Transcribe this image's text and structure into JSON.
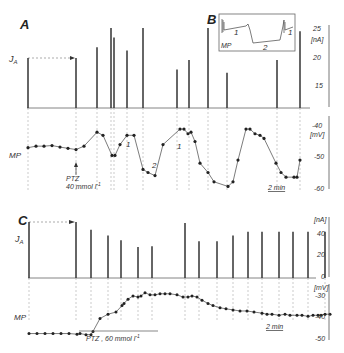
{
  "chart_data": [
    {
      "panel": "A",
      "type": "line",
      "title": "A",
      "series": [
        {
          "name": "J_A",
          "unit": "nA",
          "kind": "current pulses (stick plot)",
          "x_px": [
            28,
            76,
            97,
            111,
            114,
            127,
            143,
            177,
            189,
            208,
            227,
            277,
            300
          ],
          "values": [
            20.5,
            20.5,
            22,
            25,
            23.5,
            21.5,
            25,
            18.5,
            20,
            25,
            18,
            20,
            24.5
          ]
        },
        {
          "name": "MP",
          "unit": "mV",
          "x_px": [
            28,
            36,
            44,
            52,
            60,
            68,
            76,
            84,
            97,
            103,
            112,
            115,
            120,
            127,
            134,
            143,
            148,
            155,
            163,
            180,
            184,
            188,
            191,
            195,
            200,
            208,
            214,
            228,
            233,
            238,
            246,
            250,
            255,
            260,
            264,
            276,
            281,
            286,
            294,
            297,
            300
          ],
          "values": [
            -47,
            -46.5,
            -46.5,
            -46.3,
            -46.8,
            -47.2,
            -47.6,
            -46.5,
            -42,
            -43,
            -49.5,
            -49.5,
            -46,
            -43,
            -43,
            -54,
            -55,
            -56,
            -46,
            -41,
            -41,
            -42.5,
            -42,
            -45,
            -52,
            -55,
            -58,
            -59.5,
            -58,
            -51,
            -41,
            -41,
            -42.5,
            -43,
            -44,
            -52,
            -55,
            -56.5,
            -56.5,
            -56.5,
            -51
          ]
        }
      ],
      "annotations": [
        "PTZ 40 mmol l⁻¹",
        "1",
        "2",
        "1",
        "2 min"
      ],
      "right_axis_nA": {
        "ticks": [
          25,
          20,
          15
        ],
        "label": "[nA]"
      },
      "right_axis_mV": {
        "ticks": [
          -40,
          -50,
          -60
        ],
        "label": "[mV]"
      }
    },
    {
      "panel": "B",
      "type": "line",
      "title": "B",
      "description": "Inset MP trace: phase 1 (plateau), phase 2 (hyperpolarization), phase 1 again",
      "annotations": [
        "MP",
        "1",
        "2",
        "1"
      ]
    },
    {
      "panel": "C",
      "type": "line",
      "title": "C",
      "series": [
        {
          "name": "J_A",
          "unit": "nA",
          "kind": "current pulses (stick plot)",
          "x_px": [
            29,
            76,
            91,
            108,
            121,
            138,
            152,
            185,
            199,
            217,
            233,
            248,
            262,
            279,
            293,
            308,
            325
          ],
          "values": [
            58,
            58,
            50,
            44,
            39,
            32,
            33,
            57,
            38,
            38,
            44,
            48,
            48,
            48,
            48,
            48,
            48
          ]
        },
        {
          "name": "MP",
          "unit": "mV",
          "x_px": [
            29,
            37,
            45,
            53,
            61,
            69,
            77,
            80,
            86,
            91,
            93,
            100,
            108,
            116,
            122,
            124,
            128,
            133,
            138,
            141,
            145,
            150,
            155,
            160,
            165,
            170,
            177,
            183,
            188,
            192,
            197,
            202,
            208,
            213,
            220,
            226,
            233,
            240,
            247,
            254,
            262,
            267,
            272,
            279,
            285,
            290,
            297,
            302,
            308,
            313,
            318,
            321,
            325,
            330
          ],
          "values": [
            -47,
            -47,
            -47,
            -47,
            -47,
            -47,
            -47.3,
            -47,
            -47.5,
            -47.5,
            -46,
            -40,
            -38,
            -37,
            -34,
            -33,
            -31,
            -29.5,
            -30,
            -29.5,
            -28,
            -29,
            -29,
            -28.5,
            -28.5,
            -28.5,
            -29,
            -30,
            -30,
            -29.5,
            -30,
            -31.5,
            -33,
            -34,
            -35,
            -35.5,
            -36,
            -36.5,
            -36.5,
            -37,
            -37.5,
            -38,
            -38,
            -38.5,
            -38,
            -38.5,
            -38.5,
            -38.5,
            -39,
            -38.5,
            -38.5,
            -38.5,
            -38,
            -38
          ]
        }
      ],
      "annotations": [
        "PTZ, 60 mmol l⁻¹",
        "2 min"
      ],
      "right_axis_nA": {
        "ticks": [
          40,
          20,
          0
        ],
        "label": "[nA]"
      },
      "right_axis_mV": {
        "ticks": [
          -30,
          -40,
          -50
        ],
        "label": "[mV]"
      }
    }
  ],
  "labels": {
    "panelA": "A",
    "panelB": "B",
    "panelC": "C",
    "ja": "J",
    "ja_sub": "A",
    "mp": "MP",
    "ptzA1": "PTZ",
    "ptzA2": "40 mmol l",
    "ptzC": "PTZ , 60 mmol l",
    "sup": "-1",
    "one": "1",
    "two": "2",
    "scale": "2 min",
    "nA": "[nA]",
    "mV": "[mV]",
    "tA25": "25",
    "tA20": "20",
    "tA15": "15",
    "tAm40": "-40",
    "tAm50": "-50",
    "tAm60": "-60",
    "tC40": "40",
    "tC20": "20",
    "tC0": "0",
    "tCm30": "-30",
    "tCm40": "-40",
    "tCm50": "-50"
  }
}
